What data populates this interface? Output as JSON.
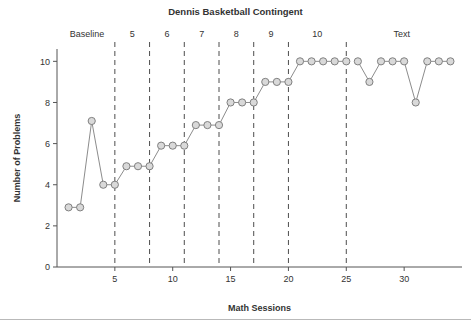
{
  "chart_data": {
    "type": "line",
    "title": "Dennis Basketball Contingent",
    "xlabel": "Math Sessions",
    "ylabel": "Number of Problems",
    "xlim": [
      0,
      35
    ],
    "ylim": [
      0,
      10.6
    ],
    "xticks": [
      5,
      10,
      15,
      20,
      25,
      30
    ],
    "yticks": [
      0,
      2,
      4,
      6,
      8,
      10
    ],
    "grid": false,
    "legend": "none",
    "marker": "circle",
    "marker_fill": "#d9d9d9",
    "marker_stroke": "#808080",
    "line_color": "#8c8c8c",
    "x": [
      1,
      2,
      3,
      4,
      5,
      6,
      7,
      8,
      9,
      10,
      11,
      12,
      13,
      14,
      15,
      16,
      17,
      18,
      19,
      20,
      21,
      22,
      23,
      24,
      25,
      26,
      27,
      28,
      29,
      30,
      31,
      32,
      33,
      34
    ],
    "values": [
      2.9,
      2.9,
      7.1,
      4.0,
      4.0,
      4.9,
      4.9,
      4.9,
      5.9,
      5.9,
      5.9,
      6.9,
      6.9,
      6.9,
      8.0,
      8.0,
      8.0,
      9.0,
      9.0,
      9.0,
      10,
      10,
      10,
      10,
      10,
      10,
      9,
      10,
      10,
      10,
      8,
      10,
      10,
      10
    ],
    "series_breaks": [
      25
    ],
    "phase_lines": [
      5,
      8,
      11,
      14,
      17,
      20,
      25
    ],
    "phase_labels": [
      {
        "text": "Baseline",
        "x": 2.6
      },
      {
        "text": "5",
        "x": 6.5
      },
      {
        "text": "6",
        "x": 9.5
      },
      {
        "text": "7",
        "x": 12.5
      },
      {
        "text": "8",
        "x": 15.5
      },
      {
        "text": "9",
        "x": 18.5
      },
      {
        "text": "10",
        "x": 22.5
      },
      {
        "text": "Text",
        "x": 29.8
      }
    ]
  }
}
